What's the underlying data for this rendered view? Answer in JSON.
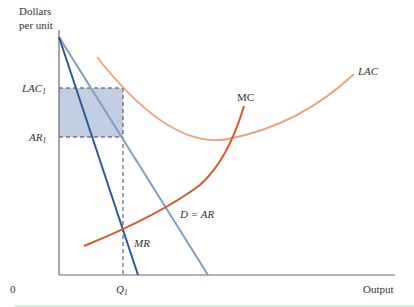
{
  "figure": {
    "y_axis_label_line1": "Dollars",
    "y_axis_label_line2": "per unit",
    "x_axis_label": "Output",
    "origin_label": "0",
    "y_ticks": [
      {
        "main": "LAC",
        "sub": "1"
      },
      {
        "main": "AR",
        "sub": "1"
      }
    ],
    "x_ticks": [
      {
        "main": "Q",
        "sub": "1"
      }
    ],
    "curves": {
      "mr": "MR",
      "demand": "D = AR",
      "mc": "MC",
      "lac": "LAC"
    },
    "colors": {
      "axis": "#6b6b6b",
      "mr": "#2a5a96",
      "demand": "#7f9ec0",
      "mc": "#d9562e",
      "lac": "#eaa27a",
      "shade": "#b7c6dc",
      "dash": "#444444",
      "bottom_rule": "#cfe3d4"
    }
  }
}
